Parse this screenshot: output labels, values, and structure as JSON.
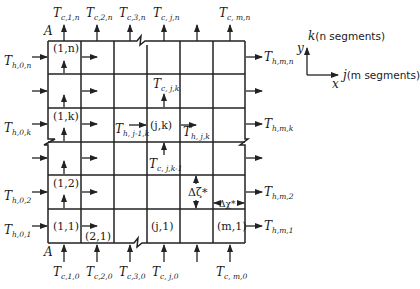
{
  "diagram": {
    "type": "finite-difference grid for crossflow heat exchanger",
    "corner_label": "A",
    "cells": {
      "c_1_n": "(1,n)",
      "c_1_k": "(1,k)",
      "c_1_2": "(1,2)",
      "c_1_1": "(1,1)",
      "c_2_1": "(2,1)",
      "c_j_k": "(j,k)",
      "c_j_1": "(j,1)",
      "c_m_1": "(m,1)"
    },
    "top_labels": [
      {
        "main": "T",
        "sub": "c,1,n"
      },
      {
        "main": "T",
        "sub": "c,2,n"
      },
      {
        "main": "T",
        "sub": "c,3,n"
      },
      {
        "main": "T",
        "sub": "c, j,n"
      },
      {
        "main": "T",
        "sub": "c, m,n"
      }
    ],
    "bottom_labels": [
      {
        "main": "T",
        "sub": "c,1,0"
      },
      {
        "main": "T",
        "sub": "c,2,0"
      },
      {
        "main": "T",
        "sub": "c,3,0"
      },
      {
        "main": "T",
        "sub": "c, j,0"
      },
      {
        "main": "T",
        "sub": "c, m,0"
      }
    ],
    "left_labels": [
      {
        "main": "T",
        "sub": "h,0,n"
      },
      {
        "main": "T",
        "sub": "h,0,k"
      },
      {
        "main": "T",
        "sub": "h,0,2"
      },
      {
        "main": "T",
        "sub": "h,0,1"
      }
    ],
    "right_labels": [
      {
        "main": "T",
        "sub": "h,m,n"
      },
      {
        "main": "T",
        "sub": "h,m,k"
      },
      {
        "main": "T",
        "sub": "h,m,2"
      },
      {
        "main": "T",
        "sub": "h,m,1"
      }
    ],
    "interior_labels": {
      "t_c_j_k": {
        "main": "T",
        "sub": "c, j,k"
      },
      "t_h_jm1_k": {
        "main": "T",
        "sub": "h, j-1,k"
      },
      "t_h_j_k": {
        "main": "T",
        "sub": "h, j,k"
      },
      "t_c_j_km1": {
        "main": "T",
        "sub": "c, j,k-1"
      }
    },
    "delta_zeta": "Δζ*",
    "delta_chi": "Δχ*",
    "axes": {
      "k_label": "k(n segments)",
      "k_prefix": "k",
      "k_suffix": "(n segments)",
      "j_prefix": "j",
      "j_suffix": "(m segments)",
      "y_label": "y",
      "x_label": "x"
    }
  }
}
